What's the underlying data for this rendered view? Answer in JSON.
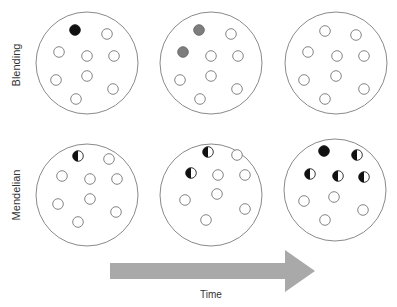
{
  "rows": [
    {
      "label": "Blending",
      "panels": [
        {
          "cx": 87,
          "cy": 63,
          "r": 51,
          "dots": [
            {
              "x": 75,
              "y": 30,
              "type": "black"
            },
            {
              "x": 107,
              "y": 34,
              "type": "white"
            },
            {
              "x": 59,
              "y": 52,
              "type": "white"
            },
            {
              "x": 87,
              "y": 56,
              "type": "white"
            },
            {
              "x": 114,
              "y": 56,
              "type": "white"
            },
            {
              "x": 56,
              "y": 80,
              "type": "white"
            },
            {
              "x": 87,
              "y": 76,
              "type": "white"
            },
            {
              "x": 113,
              "y": 89,
              "type": "white"
            },
            {
              "x": 76,
              "y": 99,
              "type": "white"
            }
          ]
        },
        {
          "cx": 211,
          "cy": 63,
          "r": 51,
          "dots": [
            {
              "x": 199,
              "y": 30,
              "type": "grey"
            },
            {
              "x": 231,
              "y": 34,
              "type": "white"
            },
            {
              "x": 183,
              "y": 52,
              "type": "grey"
            },
            {
              "x": 211,
              "y": 56,
              "type": "white"
            },
            {
              "x": 238,
              "y": 56,
              "type": "white"
            },
            {
              "x": 180,
              "y": 80,
              "type": "white"
            },
            {
              "x": 211,
              "y": 76,
              "type": "white"
            },
            {
              "x": 237,
              "y": 89,
              "type": "white"
            },
            {
              "x": 200,
              "y": 99,
              "type": "white"
            }
          ]
        },
        {
          "cx": 336,
          "cy": 63,
          "r": 51,
          "dots": [
            {
              "x": 325,
              "y": 31,
              "type": "white"
            },
            {
              "x": 356,
              "y": 35,
              "type": "white"
            },
            {
              "x": 308,
              "y": 52,
              "type": "white"
            },
            {
              "x": 337,
              "y": 56,
              "type": "white"
            },
            {
              "x": 364,
              "y": 56,
              "type": "white"
            },
            {
              "x": 304,
              "y": 80,
              "type": "white"
            },
            {
              "x": 336,
              "y": 76,
              "type": "white"
            },
            {
              "x": 364,
              "y": 89,
              "type": "white"
            },
            {
              "x": 325,
              "y": 99,
              "type": "white"
            }
          ]
        }
      ]
    },
    {
      "label": "Mendelian",
      "panels": [
        {
          "cx": 87,
          "cy": 195,
          "r": 51,
          "dots": [
            {
              "x": 78,
              "y": 156,
              "type": "half"
            },
            {
              "x": 109,
              "y": 159,
              "type": "white"
            },
            {
              "x": 62,
              "y": 176,
              "type": "white"
            },
            {
              "x": 90,
              "y": 179,
              "type": "white"
            },
            {
              "x": 117,
              "y": 179,
              "type": "white"
            },
            {
              "x": 58,
              "y": 204,
              "type": "white"
            },
            {
              "x": 90,
              "y": 199,
              "type": "white"
            },
            {
              "x": 116,
              "y": 212,
              "type": "white"
            },
            {
              "x": 78,
              "y": 222,
              "type": "white"
            }
          ]
        },
        {
          "cx": 211,
          "cy": 195,
          "r": 51,
          "dots": [
            {
              "x": 208,
              "y": 152,
              "type": "half"
            },
            {
              "x": 237,
              "y": 155,
              "type": "white"
            },
            {
              "x": 191,
              "y": 173,
              "type": "half"
            },
            {
              "x": 218,
              "y": 175,
              "type": "white"
            },
            {
              "x": 245,
              "y": 175,
              "type": "white"
            },
            {
              "x": 185,
              "y": 200,
              "type": "white"
            },
            {
              "x": 217,
              "y": 194,
              "type": "white"
            },
            {
              "x": 245,
              "y": 209,
              "type": "white"
            },
            {
              "x": 206,
              "y": 220,
              "type": "white"
            }
          ]
        },
        {
          "cx": 335,
          "cy": 190,
          "r": 51,
          "dots": [
            {
              "x": 324,
              "y": 151,
              "type": "black"
            },
            {
              "x": 357,
              "y": 155,
              "type": "half"
            },
            {
              "x": 310,
              "y": 174,
              "type": "half"
            },
            {
              "x": 338,
              "y": 176,
              "type": "half"
            },
            {
              "x": 364,
              "y": 177,
              "type": "half"
            },
            {
              "x": 304,
              "y": 201,
              "type": "white"
            },
            {
              "x": 334,
              "y": 197,
              "type": "white"
            },
            {
              "x": 363,
              "y": 210,
              "type": "white"
            },
            {
              "x": 325,
              "y": 220,
              "type": "white"
            }
          ]
        }
      ]
    }
  ],
  "arrow": {
    "label": "Time",
    "color": "#a9a9a9",
    "shaft": {
      "x1": 110,
      "x2": 285,
      "y": 271,
      "half_height": 8
    },
    "head": {
      "x_base": 285,
      "x_tip": 315,
      "half_height": 21
    }
  },
  "colors": {
    "outline": "#8a8a8a",
    "black": "#111111",
    "grey": "#7d7d7d",
    "white": "#ffffff"
  }
}
